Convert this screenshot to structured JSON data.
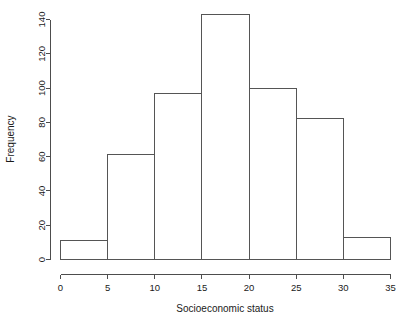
{
  "chart_data": {
    "type": "bar",
    "subtype": "histogram",
    "title": "",
    "subtitle": "",
    "xlabel": "Socioeconomic status",
    "ylabel": "Frequency",
    "categories": [
      "0-5",
      "5-10",
      "10-15",
      "15-20",
      "20-25",
      "25-30",
      "30-35"
    ],
    "bin_edges": [
      0,
      5,
      10,
      15,
      20,
      25,
      30,
      35
    ],
    "bin_width": 5,
    "values": [
      11,
      61,
      97,
      143,
      100,
      82,
      13
    ],
    "series": [
      {
        "name": "Frequency",
        "values": [
          11,
          61,
          97,
          143,
          100,
          82,
          13
        ]
      }
    ],
    "xlim": [
      0,
      35
    ],
    "ylim": [
      0,
      143
    ],
    "xticks": [
      0,
      5,
      10,
      15,
      20,
      25,
      30,
      35
    ],
    "yticks": [
      0,
      20,
      40,
      60,
      80,
      100,
      120,
      140
    ],
    "xticklabels": [
      "0",
      "5",
      "10",
      "15",
      "20",
      "25",
      "30",
      "35"
    ],
    "yticklabels": [
      "0",
      "20",
      "40",
      "60",
      "80",
      "100",
      "120",
      "140"
    ],
    "grid": false,
    "legend": false,
    "legend_position": "none",
    "bar_fill_color": "#ffffff",
    "bar_edge_color": "#555555",
    "axis_color": "#4d4d4d",
    "background_color": "#ffffff",
    "annotations": []
  },
  "figure": {
    "ylabel_text": "Frequency",
    "xlabel_text": "Socioeconomic status"
  }
}
